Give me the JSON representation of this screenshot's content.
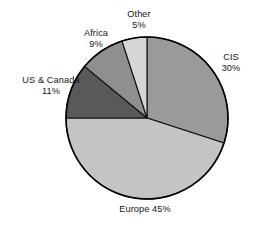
{
  "chart_data": {
    "type": "pie",
    "title": "",
    "subtitle": "",
    "xlabel": "",
    "ylabel": "",
    "grid": false,
    "legend_position": "none",
    "label_style": "outside-labels",
    "start_angle_deg": 0,
    "direction": "clockwise",
    "units": "percent",
    "total": 100,
    "categories": [
      "CIS",
      "Europe",
      "US & Canada",
      "Africa",
      "Other"
    ],
    "values": [
      30,
      45,
      11,
      9,
      5
    ],
    "slices": [
      {
        "name": "CIS",
        "value": 30,
        "value_label": "30%",
        "label_lines": [
          "CIS",
          "30%"
        ],
        "color": "#9a9a9a",
        "start_deg": 0,
        "end_deg": 108
      },
      {
        "name": "Europe",
        "value": 45,
        "value_label": "45%",
        "label_lines": [
          "Europe 45%"
        ],
        "color": "#c4c4c4",
        "start_deg": 108,
        "end_deg": 270
      },
      {
        "name": "US & Canada",
        "value": 11,
        "value_label": "11%",
        "label_lines": [
          "US & Canada",
          "11%"
        ],
        "color": "#595959",
        "start_deg": 270,
        "end_deg": 309.6
      },
      {
        "name": "Africa",
        "value": 9,
        "value_label": "9%",
        "label_lines": [
          "Africa",
          "9%"
        ],
        "color": "#8f8f8f",
        "start_deg": 309.6,
        "end_deg": 342
      },
      {
        "name": "Other",
        "value": 5,
        "value_label": "5%",
        "label_lines": [
          "Other",
          "5%"
        ],
        "color": "#d6d6d6",
        "start_deg": 342,
        "end_deg": 360
      }
    ],
    "geometry": {
      "center_x": 147,
      "center_y": 118,
      "radius": 81
    },
    "colors": {
      "cis": "#9a9a9a",
      "europe": "#c4c4c4",
      "us_canada": "#595959",
      "africa": "#8f8f8f",
      "other": "#d6d6d6",
      "outline": "#000000",
      "background": "#ffffff",
      "text": "#151515"
    }
  },
  "labels": {
    "cis": {
      "name": "CIS",
      "value": "30%"
    },
    "europe": {
      "combined": "Europe 45%"
    },
    "us_canada": {
      "name": "US & Canada",
      "value": "11%"
    },
    "africa": {
      "name": "Africa",
      "value": "9%"
    },
    "other": {
      "name": "Other",
      "value": "5%"
    }
  }
}
